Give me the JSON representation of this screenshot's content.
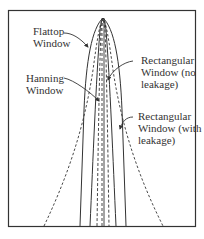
{
  "figure": {
    "type": "window-function-spectral-shapes",
    "frame_color": "#333333",
    "curve_color": "#333333"
  },
  "labels": {
    "flattop": {
      "line1": "Flattop",
      "line2": "Window"
    },
    "hanning": {
      "line1": "Hanning",
      "line2": "Window"
    },
    "rect_no_leak": {
      "line1": "Rectangular",
      "line2": "Window (no",
      "line3": "leakage)"
    },
    "rect_leak": {
      "line1": "Rectangular",
      "line2": "Window (with",
      "line3": "leakage)"
    }
  },
  "curves": [
    {
      "name": "Flattop Window",
      "style": "solid"
    },
    {
      "name": "Hanning Window",
      "style": "dashed"
    },
    {
      "name": "Rectangular Window (no leakage)",
      "style": "solid+dashed"
    },
    {
      "name": "Rectangular Window (with leakage)",
      "style": "dashed"
    }
  ]
}
